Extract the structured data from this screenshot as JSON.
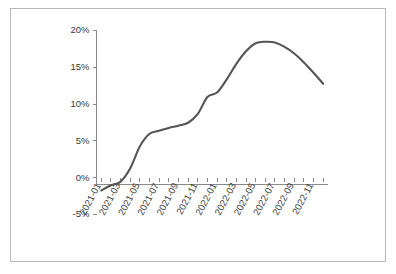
{
  "chart_data": {
    "type": "line",
    "title": "",
    "subtitle": "",
    "xlabel": "",
    "ylabel": "",
    "grid": false,
    "legend": false,
    "legend_position": "none",
    "line_color": "#555555",
    "axis_color": "#8a8a8a",
    "ylim": [
      -5,
      20
    ],
    "ytick_values": [
      20,
      15,
      10,
      5,
      0,
      -5
    ],
    "ytick_labels": [
      "20%",
      "15%",
      "10%",
      "5%",
      "0%",
      "-5%"
    ],
    "xtick_labels": [
      "2021-01",
      "2021-03",
      "2021-05",
      "2021-07",
      "2021-09",
      "2021-11",
      "2022-01",
      "2022-03",
      "2022-05",
      "2022-07",
      "2022-09",
      "2022-11"
    ],
    "x": [
      "2021-01",
      "2021-02",
      "2021-03",
      "2021-04",
      "2021-05",
      "2021-06",
      "2021-07",
      "2021-08",
      "2021-09",
      "2021-10",
      "2021-11",
      "2021-12",
      "2022-01",
      "2022-02",
      "2022-03",
      "2022-04",
      "2022-05",
      "2022-06",
      "2022-07",
      "2022-08",
      "2022-09",
      "2022-10",
      "2022-11",
      "2022-12"
    ],
    "values": [
      -1.8,
      -1.1,
      -0.6,
      1.2,
      4.2,
      5.9,
      6.3,
      6.7,
      7.0,
      7.4,
      8.6,
      10.9,
      11.5,
      13.3,
      15.4,
      17.1,
      18.2,
      18.4,
      18.3,
      17.7,
      16.8,
      15.6,
      14.2,
      12.7
    ],
    "units": "percent"
  },
  "figure": {
    "border_color": "#b9b9b9",
    "background": "#ffffff"
  }
}
